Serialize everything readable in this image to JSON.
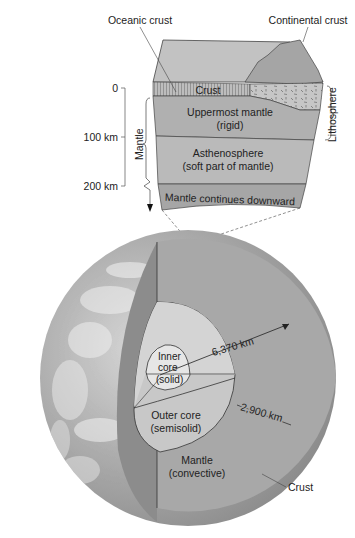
{
  "block": {
    "labels": {
      "oceanic_crust": "Oceanic crust",
      "continental_crust": "Continental crust",
      "crust": "Crust",
      "uppermost_mantle_1": "Uppermost mantle",
      "uppermost_mantle_2": "(rigid)",
      "asthenosphere_1": "Asthenosphere",
      "asthenosphere_2": "(soft part of mantle)",
      "mantle_continues": "Mantle continues downward",
      "lithosphere": "Lithosphere",
      "mantle_bracket": "Mantle"
    },
    "depth_scale": {
      "ticks": [
        {
          "label": "0",
          "value_km": 0
        },
        {
          "label": "100 km",
          "value_km": 100
        },
        {
          "label": "200 km",
          "value_km": 200
        }
      ]
    }
  },
  "globe": {
    "labels": {
      "inner_core_1": "Inner",
      "inner_core_2": "core",
      "inner_core_3": "(solid)",
      "outer_core_1": "Outer core",
      "outer_core_2": "(semisolid)",
      "mantle_1": "Mantle",
      "mantle_2": "(convective)",
      "crust": "Crust",
      "radius": "6,370 km",
      "mantle_thickness": "2,900 km"
    }
  },
  "colors": {
    "mantle_gray": "#a9a9a9",
    "sky_gray": "#c4c4c4",
    "core_outer": "#c8c8c8",
    "core_inner": "#e6e6e6",
    "crust_band": "#b8b8b8",
    "line": "#333333"
  }
}
